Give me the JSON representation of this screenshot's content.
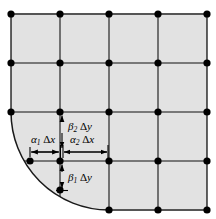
{
  "figure": {
    "background_color": "#ffffff",
    "shaded_region_color": "#e2e2e2",
    "grid_line_color": "#555555",
    "boundary_line_color": "#1a1a1a",
    "node_color": "#000000",
    "annotation_color": "#000000"
  },
  "grid": {
    "x_positions": [
      11,
      60,
      109,
      158,
      207
    ],
    "y_positions": [
      14,
      63,
      112,
      161,
      210
    ],
    "spacing_x": 49,
    "spacing_y": 49,
    "node_radius": 3.6,
    "columns": 5,
    "rows": 5
  },
  "nodes": [
    {
      "x": 11,
      "y": 14
    },
    {
      "x": 60,
      "y": 14
    },
    {
      "x": 109,
      "y": 14
    },
    {
      "x": 158,
      "y": 14
    },
    {
      "x": 207,
      "y": 14
    },
    {
      "x": 11,
      "y": 63
    },
    {
      "x": 60,
      "y": 63
    },
    {
      "x": 109,
      "y": 63
    },
    {
      "x": 158,
      "y": 63
    },
    {
      "x": 207,
      "y": 63
    },
    {
      "x": 11,
      "y": 112
    },
    {
      "x": 60,
      "y": 112
    },
    {
      "x": 109,
      "y": 112
    },
    {
      "x": 158,
      "y": 112
    },
    {
      "x": 207,
      "y": 112
    },
    {
      "x": 60,
      "y": 161
    },
    {
      "x": 109,
      "y": 161
    },
    {
      "x": 158,
      "y": 161
    },
    {
      "x": 207,
      "y": 161
    },
    {
      "x": 109,
      "y": 210
    },
    {
      "x": 158,
      "y": 210
    },
    {
      "x": 207,
      "y": 210
    }
  ],
  "boundary_nodes": [
    {
      "x": 30,
      "y": 161,
      "description": "arc crossing of horizontal gridline y3"
    },
    {
      "x": 60,
      "y": 190,
      "description": "arc crossing of vertical gridline x2"
    }
  ],
  "arc": {
    "center_x": 109,
    "center_y": 112,
    "radius": 98,
    "start_x": 11,
    "start_y": 112,
    "end_x": 109,
    "end_y": 210,
    "description": "quarter-circle curved boundary"
  },
  "annotations": {
    "alpha1": {
      "symbol": "α",
      "subscript": "1",
      "delta": "Δ",
      "variable": "x",
      "full_text": "α₁ Δx",
      "label_x": 45,
      "label_y": 141,
      "dim_y": 152,
      "dim_x_start": 30,
      "dim_x_end": 60
    },
    "alpha2": {
      "symbol": "α",
      "subscript": "2",
      "delta": "Δ",
      "variable": "x",
      "full_text": "α₂ Δx",
      "label_x": 85,
      "label_y": 141,
      "dim_y": 152,
      "dim_x_start": 62,
      "dim_x_end": 109
    },
    "beta1": {
      "symbol": "β",
      "subscript": "1",
      "delta": "Δ",
      "variable": "y",
      "full_text": "β₁ Δy",
      "label_x": 70,
      "label_y": 177,
      "dim_x": 62,
      "dim_y_start": 164,
      "dim_y_end": 190
    },
    "beta2": {
      "symbol": "β",
      "subscript": "2",
      "delta": "Δ",
      "variable": "y",
      "full_text": "β₂ Δy",
      "label_x": 70,
      "label_y": 127,
      "dim_x": 62,
      "dim_y_start": 114,
      "dim_y_end": 149
    }
  }
}
